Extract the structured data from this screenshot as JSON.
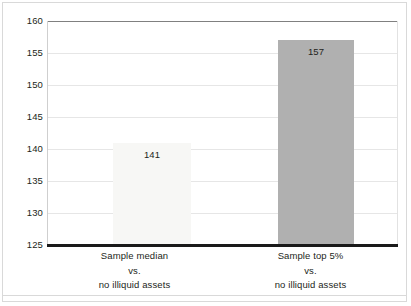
{
  "chart_data": {
    "type": "bar",
    "title": "",
    "subtitle": "",
    "xlabel": "",
    "ylabel": "",
    "ylim": [
      125,
      160
    ],
    "yticks": [
      125,
      130,
      135,
      140,
      145,
      150,
      155,
      160
    ],
    "ytick_labels": [
      "125",
      "130",
      "135",
      "140",
      "145",
      "150",
      "155",
      "160"
    ],
    "grid": true,
    "grid_axis": "y",
    "legend": false,
    "legend_position": "none",
    "categories": [
      "Sample median vs. no illiquid assets",
      "Sample top 5% vs. no illiquid assets"
    ],
    "category_lines": [
      [
        "Sample median",
        "vs.",
        "no illiquid assets"
      ],
      [
        "Sample top 5%",
        "vs.",
        "no illiquid assets"
      ]
    ],
    "values": [
      141,
      157
    ],
    "value_labels": [
      "141",
      "157"
    ],
    "bar_colors": [
      "#f7f7f5",
      "#b0b0b0"
    ]
  },
  "axis": {
    "baseline_color": "#1a1a1a",
    "top_rule_color": "#808080",
    "gridline_color": "#e6e6e6",
    "frame_color": "#d9d9d9"
  }
}
